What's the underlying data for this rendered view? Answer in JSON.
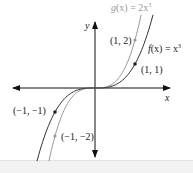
{
  "figure": {
    "axes": {
      "x_label": "x",
      "y_label": "y"
    },
    "functions": [
      {
        "id": "f",
        "label": "f(x) = x³",
        "label_name": "f",
        "label_rest": "(x) = x",
        "exponent": "3",
        "color": "#333333",
        "coefficient": 1
      },
      {
        "id": "g",
        "label": "g(x) = 2x³",
        "label_name": "g",
        "label_rest": "(x) = 2x",
        "exponent": "3",
        "color": "#999999",
        "coefficient": 2
      }
    ],
    "points": [
      {
        "label": "(1, 2)",
        "x": 1,
        "y": 2,
        "curve": "g"
      },
      {
        "label": "(1, 1)",
        "x": 1,
        "y": 1,
        "curve": "f"
      },
      {
        "label": "(−1, −1)",
        "x": -1,
        "y": -1,
        "curve": "f"
      },
      {
        "label": "(−1, −2)",
        "x": -1,
        "y": -2,
        "curve": "g"
      }
    ]
  }
}
